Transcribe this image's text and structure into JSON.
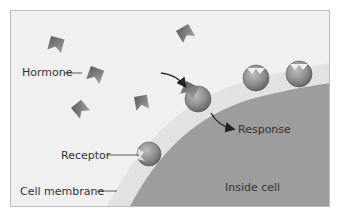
{
  "diagram": {
    "labels": {
      "hormone": "Hormone",
      "receptor": "Receptor",
      "cell_membrane": "Cell membrane",
      "response": "Response",
      "inside_cell": "Inside cell"
    },
    "colors": {
      "background": "#f0f0f0",
      "membrane_strip": "#e2e2e2",
      "inside_cell": "#9d9d9d",
      "hormone": "#7f7f7f",
      "receptor": "#8a8a8a",
      "frame_border": "#bdbdbd",
      "text": "#333333",
      "arrow": "#222222"
    }
  }
}
